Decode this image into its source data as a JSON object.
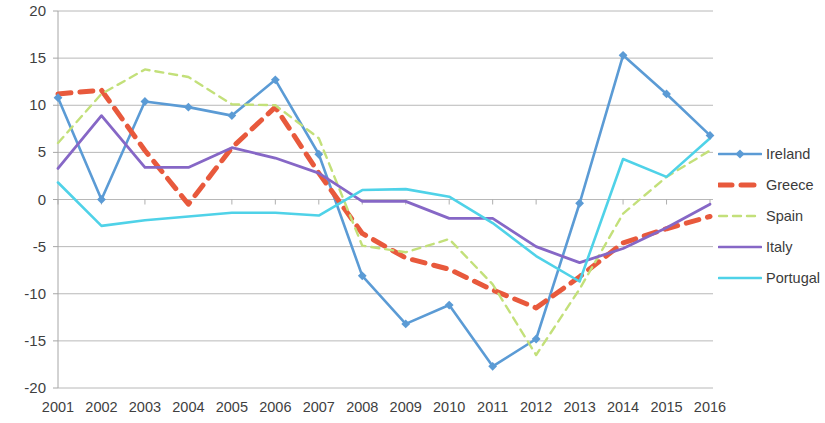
{
  "chart_data": {
    "type": "line",
    "title": "",
    "subtitle": "",
    "xlabel": "",
    "ylabel": "",
    "grid": true,
    "legend_position": "right",
    "categories": [
      2001,
      2002,
      2003,
      2004,
      2005,
      2006,
      2007,
      2008,
      2009,
      2010,
      2011,
      2012,
      2013,
      2014,
      2015,
      2016
    ],
    "x": [
      "2001",
      "2002",
      "2003",
      "2004",
      "2005",
      "2006",
      "2007",
      "2008",
      "2009",
      "2010",
      "2011",
      "2012",
      "2013",
      "2014",
      "2015",
      "2016"
    ],
    "xlim": [
      2001,
      2016
    ],
    "ylim": [
      -20,
      20
    ],
    "ytick_labels": [
      "20",
      "15",
      "10",
      "5",
      "0",
      "-5",
      "-10",
      "-15",
      "-20"
    ],
    "yticks": [
      20,
      15,
      10,
      5,
      0,
      -5,
      -10,
      -15,
      -20
    ],
    "xtick_labels": [
      "2001",
      "2002",
      "2003",
      "2004",
      "2005",
      "2006",
      "2007",
      "2008",
      "2009",
      "2010",
      "2011",
      "2012",
      "2013",
      "2014",
      "2015",
      "2016"
    ],
    "series": [
      {
        "name": "Ireland",
        "color": "#5b9bd5",
        "style": "solid",
        "marker": "diamond",
        "width": 2.6,
        "values": [
          10.8,
          0.0,
          10.4,
          9.8,
          8.9,
          12.7,
          4.8,
          -8.1,
          -13.2,
          -11.2,
          -17.7,
          -14.8,
          -0.4,
          15.3,
          11.2,
          6.8
        ]
      },
      {
        "name": "Greece",
        "color": "#e8593c",
        "style": "dashed-thick",
        "marker": "none",
        "width": 5.0,
        "values": [
          11.2,
          11.6,
          5.2,
          -0.5,
          5.5,
          9.8,
          2.8,
          -3.6,
          -6.2,
          -7.4,
          -9.6,
          -11.5,
          -8.2,
          -4.6,
          -3.1,
          -1.8
        ]
      },
      {
        "name": "Spain",
        "color": "#c3e07a",
        "style": "dashed",
        "marker": "none",
        "width": 2.4,
        "values": [
          6.0,
          11.2,
          13.8,
          13.0,
          10.1,
          10.0,
          6.5,
          -4.9,
          -5.6,
          -4.2,
          -9.0,
          -16.5,
          -9.5,
          -1.5,
          2.4,
          5.2
        ]
      },
      {
        "name": "Italy",
        "color": "#8667c6",
        "style": "solid",
        "marker": "none",
        "width": 2.8,
        "values": [
          3.3,
          8.9,
          3.4,
          3.4,
          5.5,
          4.4,
          2.8,
          -0.2,
          -0.2,
          -2.0,
          -2.0,
          -5.0,
          -6.7,
          -5.2,
          -3.0,
          -0.5
        ]
      },
      {
        "name": "Portugal",
        "color": "#4fd2e8",
        "style": "solid",
        "marker": "none",
        "width": 2.6,
        "values": [
          1.8,
          -2.8,
          -2.2,
          -1.8,
          -1.4,
          -1.4,
          -1.7,
          1.0,
          1.1,
          0.3,
          -2.5,
          -6.0,
          -8.7,
          4.3,
          2.4,
          6.5
        ]
      }
    ]
  },
  "legend": {
    "items": [
      {
        "label": "Ireland",
        "color": "#5b9bd5",
        "style": "solid",
        "marker": "diamond"
      },
      {
        "label": "Greece",
        "color": "#e8593c",
        "style": "dashed-thick",
        "marker": "none"
      },
      {
        "label": "Spain",
        "color": "#c3e07a",
        "style": "dashed",
        "marker": "none"
      },
      {
        "label": "Italy",
        "color": "#8667c6",
        "style": "solid",
        "marker": "none"
      },
      {
        "label": "Portugal",
        "color": "#4fd2e8",
        "style": "solid",
        "marker": "none"
      }
    ]
  },
  "axes": {
    "y_labels": [
      "20",
      "15",
      "10",
      "5",
      "0",
      "-5",
      "-10",
      "-15",
      "-20"
    ],
    "x_labels": [
      "2001",
      "2002",
      "2003",
      "2004",
      "2005",
      "2006",
      "2007",
      "2008",
      "2009",
      "2010",
      "2011",
      "2012",
      "2013",
      "2014",
      "2015",
      "2016"
    ]
  },
  "colors": {
    "grid": "#a6a6a6",
    "axis": "#a6a6a6",
    "text": "#3f3f3f",
    "background": "#ffffff"
  }
}
